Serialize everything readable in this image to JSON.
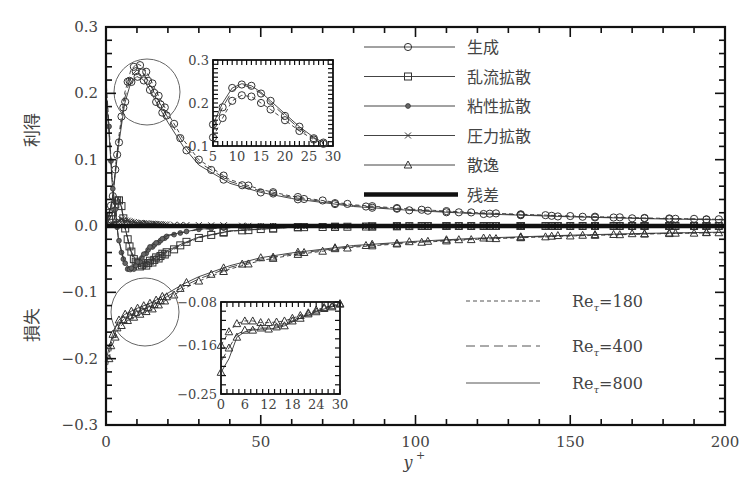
{
  "chart_data": {
    "type": "line",
    "title": "",
    "xlabel": "y+",
    "ylabel_positive": "利得",
    "ylabel_negative": "損失",
    "xlim": [
      0,
      200
    ],
    "ylim": [
      -0.3,
      0.3
    ],
    "x_ticks": [
      "0",
      "50",
      "100",
      "150",
      "200"
    ],
    "y_ticks": [
      "0.3",
      "0.2",
      "0.1",
      "0.0",
      "-0.1",
      "-0.2",
      "-0.3"
    ],
    "grid": false,
    "legend_terms": [
      {
        "name": "生成",
        "marker": "circle"
      },
      {
        "name": "乱流拡散",
        "marker": "square"
      },
      {
        "name": "粘性拡散",
        "marker": "dot"
      },
      {
        "name": "圧力拡散",
        "marker": "cross"
      },
      {
        "name": "散逸",
        "marker": "triangle"
      },
      {
        "name": "残差",
        "marker": "thick-line"
      }
    ],
    "legend_reynolds": [
      {
        "label": "Reτ=180",
        "style": "short-dash"
      },
      {
        "label": "Reτ=400",
        "style": "long-dash"
      },
      {
        "label": "Reτ=800",
        "style": "solid"
      }
    ],
    "series": [
      {
        "name": "生成 (Production)",
        "x": [
          0,
          2,
          4,
          6,
          8,
          10,
          12,
          14,
          16,
          20,
          25,
          30,
          40,
          50,
          60,
          80,
          100,
          120,
          150,
          175,
          200
        ],
        "values": [
          0.0,
          0.04,
          0.13,
          0.2,
          0.235,
          0.245,
          0.24,
          0.225,
          0.205,
          0.17,
          0.13,
          0.1,
          0.07,
          0.055,
          0.045,
          0.032,
          0.025,
          0.02,
          0.015,
          0.012,
          0.01
        ]
      },
      {
        "name": "乱流拡散 (Turbulent diffusion)",
        "x": [
          0,
          2,
          4,
          5,
          6,
          8,
          10,
          12,
          15,
          20,
          25,
          30,
          40,
          60,
          100,
          200
        ],
        "values": [
          0.0,
          0.02,
          0.045,
          0.03,
          0.0,
          -0.04,
          -0.06,
          -0.062,
          -0.055,
          -0.04,
          -0.028,
          -0.018,
          -0.008,
          -0.002,
          0.0,
          0.0
        ]
      },
      {
        "name": "粘性拡散 (Viscous diffusion)",
        "x": [
          0,
          1,
          2,
          4,
          6,
          8,
          10,
          14,
          20,
          30,
          50,
          200
        ],
        "values": [
          0.22,
          0.15,
          0.07,
          -0.02,
          -0.06,
          -0.07,
          -0.06,
          -0.035,
          -0.015,
          -0.005,
          0.0,
          0.0
        ]
      },
      {
        "name": "圧力拡散 (Pressure diffusion)",
        "x": [
          0,
          5,
          10,
          20,
          50,
          200
        ],
        "values": [
          0.0,
          0.01,
          0.005,
          0.002,
          0.0,
          0.0
        ]
      },
      {
        "name": "散逸 (Dissipation)",
        "x": [
          0,
          2,
          4,
          6,
          8,
          10,
          15,
          20,
          25,
          30,
          40,
          50,
          60,
          80,
          100,
          120,
          150,
          175,
          200
        ],
        "values": [
          -0.22,
          -0.18,
          -0.155,
          -0.145,
          -0.14,
          -0.135,
          -0.125,
          -0.11,
          -0.095,
          -0.083,
          -0.065,
          -0.052,
          -0.044,
          -0.032,
          -0.025,
          -0.02,
          -0.015,
          -0.012,
          -0.01
        ]
      },
      {
        "name": "残差 (Residual)",
        "x": [
          0,
          200
        ],
        "values": [
          0.0,
          0.0
        ]
      }
    ],
    "inset_production": {
      "xlim": [
        5,
        30
      ],
      "ylim": [
        0.1,
        0.3
      ],
      "x_ticks": [
        "5",
        "10",
        "15",
        "20",
        "25",
        "30"
      ],
      "y_ticks": [
        "0.3",
        "0.2",
        "0.1"
      ],
      "series": [
        {
          "name": "Reτ=180",
          "x": [
            5,
            7,
            9,
            11,
            13,
            15,
            17,
            20,
            23,
            26,
            28
          ],
          "values": [
            0.12,
            0.165,
            0.205,
            0.218,
            0.215,
            0.2,
            0.185,
            0.16,
            0.135,
            0.115,
            0.105
          ]
        },
        {
          "name": "Reτ=400",
          "x": [
            5,
            7,
            9,
            11,
            13,
            15,
            17,
            20,
            23,
            26,
            28
          ],
          "values": [
            0.14,
            0.19,
            0.228,
            0.243,
            0.235,
            0.222,
            0.2,
            0.17,
            0.14,
            0.118,
            0.107
          ]
        },
        {
          "name": "Reτ=800",
          "x": [
            5,
            7,
            9,
            11,
            13,
            15,
            17,
            20,
            23,
            26,
            28
          ],
          "values": [
            0.15,
            0.2,
            0.235,
            0.245,
            0.24,
            0.225,
            0.205,
            0.175,
            0.145,
            0.12,
            0.108
          ]
        }
      ]
    },
    "inset_dissipation": {
      "xlim": [
        0,
        30
      ],
      "ylim": [
        -0.25,
        -0.08
      ],
      "x_ticks": [
        "0",
        "6",
        "12",
        "18",
        "24",
        "30"
      ],
      "y_ticks": [
        "-0.08",
        "-0.16",
        "-0.25"
      ],
      "series": [
        {
          "name": "Reτ=180",
          "x": [
            0,
            2,
            4,
            6,
            8,
            10,
            12,
            14,
            16,
            18,
            20,
            22,
            24,
            26,
            28,
            30
          ],
          "values": [
            -0.16,
            -0.135,
            -0.12,
            -0.115,
            -0.115,
            -0.118,
            -0.118,
            -0.117,
            -0.115,
            -0.11,
            -0.105,
            -0.1,
            -0.095,
            -0.09,
            -0.087,
            -0.083
          ]
        },
        {
          "name": "Reτ=400",
          "x": [
            0,
            2,
            4,
            6,
            8,
            10,
            12,
            14,
            16,
            18,
            20,
            22,
            24,
            26,
            28,
            30
          ],
          "values": [
            -0.19,
            -0.165,
            -0.14,
            -0.132,
            -0.13,
            -0.128,
            -0.128,
            -0.126,
            -0.122,
            -0.115,
            -0.108,
            -0.102,
            -0.097,
            -0.092,
            -0.088,
            -0.084
          ]
        },
        {
          "name": "Reτ=800",
          "x": [
            0,
            2,
            4,
            6,
            8,
            10,
            12,
            14,
            16,
            18,
            20,
            22,
            24,
            26,
            28,
            30
          ],
          "values": [
            -0.21,
            -0.185,
            -0.145,
            -0.135,
            -0.132,
            -0.13,
            -0.13,
            -0.128,
            -0.124,
            -0.117,
            -0.11,
            -0.104,
            -0.098,
            -0.093,
            -0.089,
            -0.085
          ]
        }
      ]
    },
    "annotations": [
      "circle around production peak near y+≈12",
      "circle around dissipation near wall"
    ]
  }
}
